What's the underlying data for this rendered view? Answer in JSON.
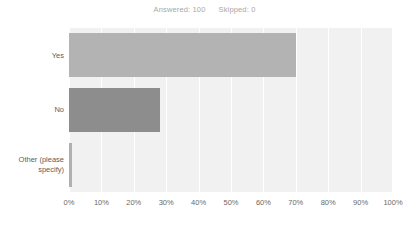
{
  "header": {
    "answered_label": "Answered: 100",
    "skipped_label": "Skipped: 0"
  },
  "colors": {
    "plot_background": "#f1f1f1",
    "gridline": "#ffffff",
    "bar_yes": "#b3b3b3",
    "bar_no": "#8d8d8d",
    "bar_other": "#b0b0b0",
    "label_text": "#5d5d5d",
    "header_text": "#a8a8a8"
  },
  "chart_data": {
    "type": "bar",
    "orientation": "horizontal",
    "title": "",
    "subtitle": "Answered: 100    Skipped: 0",
    "xlabel": "",
    "ylabel": "",
    "categories": [
      "Yes",
      "No",
      "Other (please specify)"
    ],
    "values": [
      70,
      28,
      1
    ],
    "value_unit": "%",
    "xlim": [
      0,
      100
    ],
    "xticks": [
      0,
      10,
      20,
      30,
      40,
      50,
      60,
      70,
      80,
      90,
      100
    ],
    "xticklabels": [
      "0%",
      "10%",
      "20%",
      "30%",
      "40%",
      "50%",
      "60%",
      "70%",
      "80%",
      "90%",
      "100%"
    ],
    "grid": true,
    "grid_axis": "x",
    "legend": false,
    "bar_colors": [
      "#b3b3b3",
      "#8d8d8d",
      "#b0b0b0"
    ]
  }
}
